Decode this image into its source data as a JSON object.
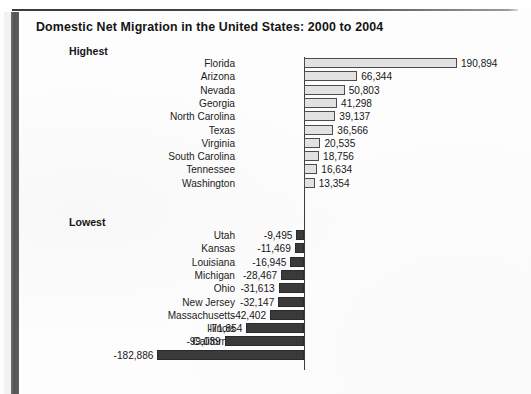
{
  "chart_data": {
    "type": "bar",
    "title": "Domestic Net Migration in the United States: 2000 to 2004",
    "orientation": "horizontal",
    "xlabel": "",
    "ylabel": "",
    "grid": false,
    "legend": false,
    "baseline": 0,
    "xlim": [
      -182886,
      190894
    ],
    "groups": [
      {
        "name": "Highest",
        "categories": [
          "Florida",
          "Arizona",
          "Nevada",
          "Georgia",
          "North Carolina",
          "Texas",
          "Virginia",
          "South Carolina",
          "Tennessee",
          "Washington"
        ],
        "values": [
          190894,
          66344,
          50803,
          41298,
          39137,
          36566,
          20535,
          18756,
          16634,
          13354
        ],
        "labels": [
          "190,894",
          "66,344",
          "50,803",
          "41,298",
          "39,137",
          "36,566",
          "20,535",
          "18,756",
          "16,634",
          "13,354"
        ]
      },
      {
        "name": "Lowest",
        "categories": [
          "Utah",
          "Kansas",
          "Louisiana",
          "Michigan",
          "Ohio",
          "New Jersey",
          "Massachusetts",
          "Illinois",
          "California",
          "New York"
        ],
        "values": [
          -9495,
          -11469,
          -16945,
          -28467,
          -31613,
          -32147,
          -42402,
          -71854,
          -99039,
          -182886
        ],
        "labels": [
          "-9,495",
          "-11,469",
          "-16,945",
          "-28,467",
          "-31,613",
          "-32,147",
          "-42,402",
          "-71,854",
          "-99,039",
          "-182,886"
        ]
      }
    ],
    "colors": {
      "positive_fill": "#e2e2e2",
      "positive_border": "#4c4c4c",
      "negative_fill": "#3a3a3a",
      "axis": "#3c3c3c",
      "text": "#171717",
      "page": "#fdfdfd"
    }
  },
  "header": {
    "title": "Domestic Net Migration in the United States: 2000 to 2004"
  },
  "sections": {
    "highest_label": "Highest",
    "lowest_label": "Lowest"
  }
}
